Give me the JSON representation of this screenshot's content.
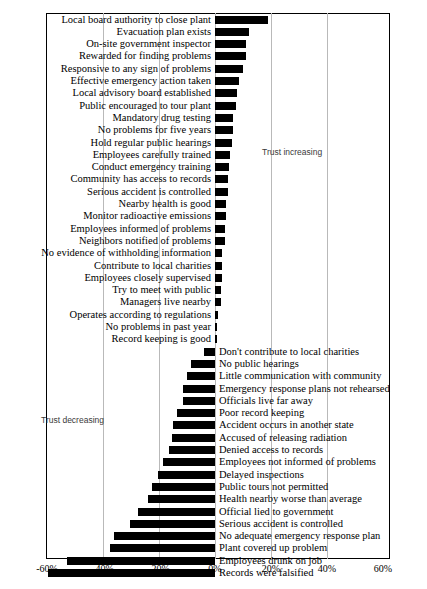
{
  "chart_data": {
    "type": "bar",
    "title": "",
    "subtitle": "",
    "xlabel": "",
    "ylabel": "",
    "orientation": "horizontal",
    "grid": true,
    "xlim": [
      -60,
      60
    ],
    "xticks": [
      -60,
      -40,
      -20,
      0,
      20,
      40,
      60
    ],
    "xtick_labels": [
      "-60%",
      "-40%",
      "-20%",
      "0%",
      "20%",
      "40%",
      "60%"
    ],
    "annotations": [
      {
        "text": "Trust increasing",
        "position": "upper-right"
      },
      {
        "text": "Trust decreasing",
        "position": "lower-left"
      }
    ],
    "series_name": "Change in trust",
    "categories": [
      "Local board authority to close plant",
      "Evacuation plan exists",
      "On-site government inspector",
      "Rewarded for finding problems",
      "Responsive to any sign of problems",
      "Effective emergency action taken",
      "Local advisory board established",
      "Public encouraged to tour plant",
      "Mandatory drug testing",
      "No problems for five years",
      "Hold regular public hearings",
      "Employees carefully trained",
      "Conduct emergency training",
      "Community has access to records",
      "Serious accident is controlled",
      "Nearby health is good",
      "Monitor radioactive emissions",
      "Employees informed of problems",
      "Neighbors notified of problems",
      "No evidence of withholding information",
      "Contribute to local charities",
      "Employees closely supervised",
      "Try to meet with public",
      "Managers live nearby",
      "Operates according to regulations",
      "No problems in past year",
      "Record keeping is good",
      "Don't contribute to local charities",
      "No public hearings",
      "Little communication with community",
      "Emergency response plans not rehearsed",
      "Officials live far away",
      "Poor record keeping",
      "Accident occurs in another state",
      "Accused of releasing radiation",
      "Denied access to records",
      "Employees not informed of problems",
      "Delayed inspections",
      "Public tours not permitted",
      "Health nearby worse than average",
      "Official lied to government",
      "Serious accident is controlled",
      "No adequate emergency response plan",
      "Plant covered up problem",
      "Employees drunk on job",
      "Records were falsified"
    ],
    "values": [
      19,
      12,
      11,
      11,
      10,
      8.5,
      8,
      7.5,
      6.5,
      6.5,
      6,
      5.5,
      5,
      4.5,
      4.5,
      4,
      4,
      3.5,
      3.5,
      2.5,
      2.5,
      2.5,
      2,
      2,
      1,
      0.7,
      0.7,
      -4,
      -8.5,
      -10,
      -11.5,
      -11.5,
      -13.5,
      -15,
      -15.5,
      -16.5,
      -18.5,
      -20.5,
      -22.5,
      -24,
      -27.5,
      -30.5,
      -36,
      -37.5,
      -53,
      -59.5
    ],
    "label_side": [
      "left",
      "left",
      "left",
      "left",
      "left",
      "left",
      "left",
      "left",
      "left",
      "left",
      "left",
      "left",
      "left",
      "left",
      "left",
      "left",
      "left",
      "left",
      "left",
      "left",
      "left",
      "left",
      "left",
      "left",
      "left",
      "left",
      "left",
      "right",
      "right",
      "right",
      "right",
      "right",
      "right",
      "right",
      "right",
      "right",
      "right",
      "right",
      "right",
      "right",
      "right",
      "right",
      "right",
      "right",
      "right",
      "right"
    ]
  },
  "style": {
    "bar_color": "#000000",
    "background": "#ffffff",
    "gridline_color": "#b9b9b9",
    "annotation_color": "#3a3a3a"
  }
}
